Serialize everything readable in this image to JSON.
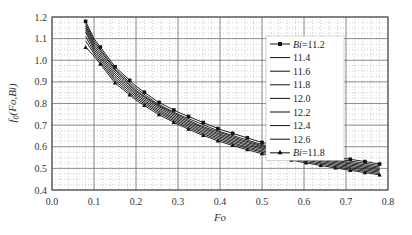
{
  "chart_data": {
    "type": "line",
    "title": "",
    "xlabel": "Fo",
    "ylabel": "f0(Fo,Bi)",
    "xlim": [
      0.0,
      0.8
    ],
    "ylim": [
      0.4,
      1.2
    ],
    "xticks": [
      "0.0",
      "0.1",
      "0.2",
      "0.3",
      "0.4",
      "0.5",
      "0.6",
      "0.7",
      "0.8"
    ],
    "yticks": [
      "0.4",
      "0.5",
      "0.6",
      "0.7",
      "0.8",
      "0.9",
      "1.0",
      "1.1",
      "1.2"
    ],
    "grid": true,
    "legend_position": "upper right",
    "x": [
      0.08,
      0.1,
      0.15,
      0.2,
      0.25,
      0.3,
      0.35,
      0.4,
      0.45,
      0.5,
      0.55,
      0.6,
      0.65,
      0.7,
      0.75,
      0.78
    ],
    "series": [
      {
        "name": "Bi=11.2",
        "marker": "square",
        "values": [
          1.18,
          1.1,
          0.97,
          0.88,
          0.81,
          0.76,
          0.72,
          0.68,
          0.65,
          0.62,
          0.6,
          0.58,
          0.56,
          0.545,
          0.53,
          0.52
        ]
      },
      {
        "name": "11.4",
        "values": [
          1.17,
          1.09,
          0.96,
          0.87,
          0.8,
          0.75,
          0.71,
          0.67,
          0.64,
          0.61,
          0.59,
          0.57,
          0.55,
          0.537,
          0.522,
          0.513
        ]
      },
      {
        "name": "11.6",
        "values": [
          1.16,
          1.08,
          0.955,
          0.86,
          0.795,
          0.745,
          0.7,
          0.665,
          0.633,
          0.605,
          0.583,
          0.563,
          0.545,
          0.53,
          0.515,
          0.506
        ]
      },
      {
        "name": "11.8",
        "values": [
          1.15,
          1.07,
          0.945,
          0.855,
          0.79,
          0.738,
          0.695,
          0.658,
          0.627,
          0.6,
          0.577,
          0.557,
          0.54,
          0.524,
          0.509,
          0.5
        ]
      },
      {
        "name": "12.0",
        "values": [
          1.14,
          1.06,
          0.935,
          0.847,
          0.783,
          0.731,
          0.688,
          0.652,
          0.62,
          0.594,
          0.571,
          0.551,
          0.534,
          0.518,
          0.503,
          0.494
        ]
      },
      {
        "name": "12.2",
        "values": [
          1.13,
          1.05,
          0.925,
          0.84,
          0.775,
          0.724,
          0.681,
          0.645,
          0.614,
          0.588,
          0.565,
          0.545,
          0.528,
          0.512,
          0.497,
          0.488
        ]
      },
      {
        "name": "12.4",
        "values": [
          1.11,
          1.04,
          0.915,
          0.832,
          0.768,
          0.717,
          0.674,
          0.638,
          0.607,
          0.581,
          0.559,
          0.539,
          0.522,
          0.506,
          0.491,
          0.482
        ]
      },
      {
        "name": "12.6",
        "values": [
          1.09,
          1.03,
          0.905,
          0.824,
          0.761,
          0.71,
          0.667,
          0.631,
          0.601,
          0.575,
          0.553,
          0.533,
          0.516,
          0.5,
          0.485,
          0.476
        ]
      },
      {
        "name": "Bi=11.8",
        "marker": "triangle",
        "values": [
          1.06,
          1.02,
          0.895,
          0.816,
          0.753,
          0.703,
          0.66,
          0.624,
          0.594,
          0.568,
          0.546,
          0.527,
          0.51,
          0.494,
          0.479,
          0.47
        ]
      }
    ]
  },
  "legend": {
    "items": [
      "Bi=11.2",
      "11.4",
      "11.6",
      "11.8",
      "12.0",
      "12.2",
      "12.4",
      "12.6",
      "Bi=11.8"
    ]
  }
}
